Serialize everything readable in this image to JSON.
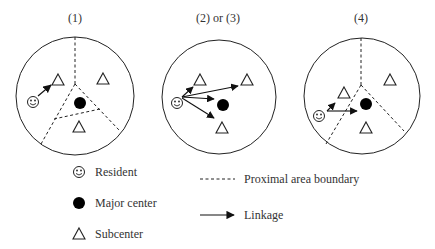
{
  "panels": [
    {
      "title": "(1)",
      "scenario": "resident links to nearest subcenter within proximal area"
    },
    {
      "title": "(2) or (3)",
      "scenario": "resident links to all subcenters and major center"
    },
    {
      "title": "(4)",
      "scenario": "resident links to subcenter and major center"
    }
  ],
  "legend": {
    "resident": "Resident",
    "major_center": "Major center",
    "subcenter": "Subcenter",
    "boundary": "Proximal area boundary",
    "linkage": "Linkage"
  },
  "colors": {
    "stroke": "#222222",
    "fill": "#000000",
    "background": "#ffffff"
  }
}
